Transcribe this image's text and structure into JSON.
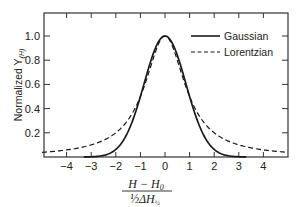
{
  "chart_data": {
    "type": "line",
    "title": "",
    "xlabel": "(H − H0) / (½ ΔH½)",
    "ylabel": "Normalized Y(H)",
    "xlim": [
      -5,
      5
    ],
    "ylim": [
      0,
      1.15
    ],
    "xticks": [
      -4,
      -3,
      -2,
      -1,
      0,
      1,
      2,
      3,
      4
    ],
    "xtick_labels": [
      "−4",
      "−3",
      "−2",
      "−1",
      "0",
      "1",
      "2",
      "3",
      "4"
    ],
    "yticks": [
      0.2,
      0.4,
      0.6,
      0.8,
      1.0
    ],
    "ytick_labels": [
      "0.2",
      "0.4",
      "0.6",
      "0.8",
      "1.0"
    ],
    "grid": false,
    "legend_position": "upper right",
    "series": [
      {
        "name": "Gaussian",
        "style": "solid",
        "x": [
          -3.3,
          -3,
          -2.5,
          -2,
          -1.5,
          -1,
          -0.5,
          0,
          0.5,
          1,
          1.5,
          2,
          2.5,
          3,
          3.3
        ],
        "values": [
          0.0005,
          0.002,
          0.013,
          0.0625,
          0.21,
          0.5,
          0.84,
          1.0,
          0.84,
          0.5,
          0.21,
          0.0625,
          0.013,
          0.002,
          0.0005
        ]
      },
      {
        "name": "Lorentzian",
        "style": "dashed",
        "x": [
          -5,
          -4.5,
          -4,
          -3.5,
          -3,
          -2.5,
          -2,
          -1.5,
          -1,
          -0.5,
          0,
          0.5,
          1,
          1.5,
          2,
          2.5,
          3,
          3.5,
          4,
          4.5,
          5
        ],
        "values": [
          0.038,
          0.047,
          0.059,
          0.075,
          0.1,
          0.138,
          0.2,
          0.308,
          0.5,
          0.8,
          1.0,
          0.8,
          0.5,
          0.308,
          0.2,
          0.138,
          0.1,
          0.075,
          0.059,
          0.047,
          0.038
        ]
      }
    ]
  },
  "legend": {
    "items": [
      {
        "label": "Gaussian",
        "style": "solid"
      },
      {
        "label": "Lorentzian",
        "style": "dashed"
      }
    ]
  },
  "axes": {
    "ylabel_main": "Normalized Y",
    "ylabel_sub": "(H)",
    "xlabel_num": "H − H",
    "xlabel_num_sub": "0",
    "xlabel_den": "½ΔH",
    "xlabel_den_sub": "½"
  },
  "colors": {
    "line": "#1a1a1a",
    "axis": "#333333",
    "background": "#ffffff"
  }
}
